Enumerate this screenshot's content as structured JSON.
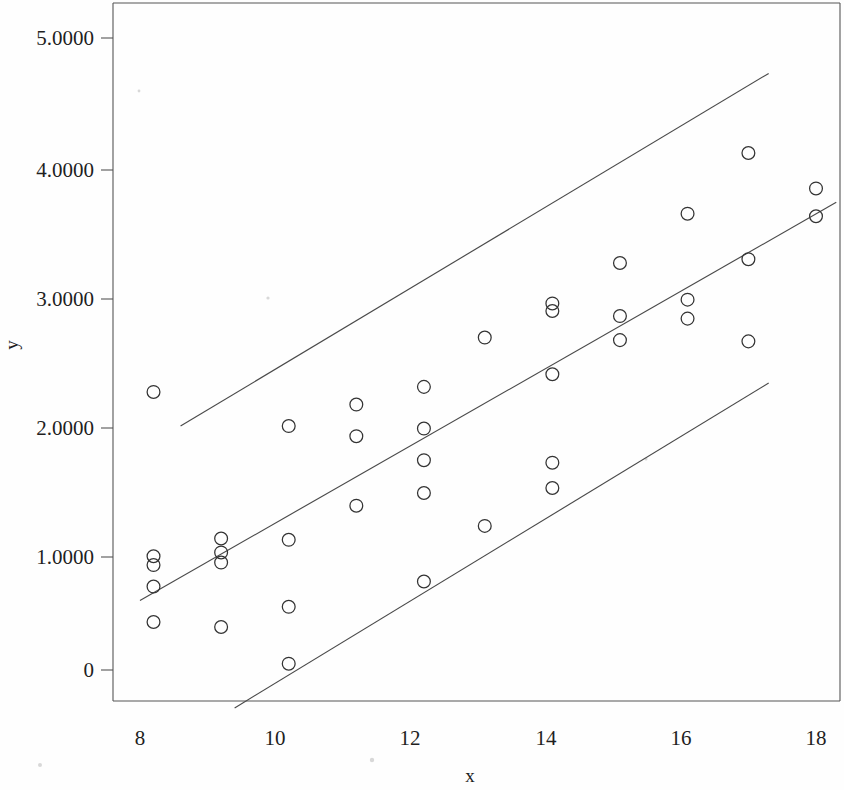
{
  "figure": {
    "background_color": "#fefefe",
    "line_color": "#4a4a4a",
    "marker_color": "#333333",
    "axis_color": "#555555"
  },
  "axes": {
    "x_title": "x",
    "y_title": "y",
    "x_ticks": [
      "8",
      "10",
      "12",
      "14",
      "16",
      "18"
    ],
    "y_ticks": [
      "5.0000",
      "4.0000",
      "3.0000",
      "2.0000",
      "1.0000",
      "0"
    ]
  },
  "chart_data": {
    "type": "scatter",
    "title": "",
    "xlabel": "x",
    "ylabel": "y",
    "xlim": [
      7.2,
      18.5
    ],
    "ylim": [
      -0.35,
      5.4
    ],
    "x_ticks": [
      8,
      10,
      12,
      14,
      16,
      18
    ],
    "y_ticks": [
      5.0,
      4.0,
      3.0,
      2.0,
      1.0,
      0
    ],
    "y_tick_labels": [
      "5.0000",
      "4.0000",
      "3.0000",
      "2.0000",
      "1.0000",
      "0"
    ],
    "x_tick_labels": [
      "8",
      "10",
      "12",
      "14",
      "16",
      "18"
    ],
    "grid": false,
    "legend": null,
    "marker": "open-circle",
    "points": [
      {
        "x": 8.2,
        "y": 2.2
      },
      {
        "x": 8.2,
        "y": 0.9
      },
      {
        "x": 8.2,
        "y": 0.83
      },
      {
        "x": 8.2,
        "y": 0.66
      },
      {
        "x": 8.2,
        "y": 0.38
      },
      {
        "x": 9.2,
        "y": 1.04
      },
      {
        "x": 9.2,
        "y": 0.93
      },
      {
        "x": 9.2,
        "y": 0.85
      },
      {
        "x": 9.2,
        "y": 0.34
      },
      {
        "x": 10.2,
        "y": 1.93
      },
      {
        "x": 10.2,
        "y": 1.03
      },
      {
        "x": 10.2,
        "y": 0.5
      },
      {
        "x": 10.2,
        "y": 0.05
      },
      {
        "x": 11.2,
        "y": 2.1
      },
      {
        "x": 11.2,
        "y": 1.85
      },
      {
        "x": 11.2,
        "y": 1.3
      },
      {
        "x": 12.2,
        "y": 2.24
      },
      {
        "x": 12.2,
        "y": 1.91
      },
      {
        "x": 12.2,
        "y": 1.66
      },
      {
        "x": 12.2,
        "y": 1.4
      },
      {
        "x": 12.2,
        "y": 0.7
      },
      {
        "x": 13.1,
        "y": 2.63
      },
      {
        "x": 13.1,
        "y": 1.14
      },
      {
        "x": 14.1,
        "y": 2.9
      },
      {
        "x": 14.1,
        "y": 2.84
      },
      {
        "x": 14.1,
        "y": 2.34
      },
      {
        "x": 14.1,
        "y": 1.64
      },
      {
        "x": 14.1,
        "y": 1.44
      },
      {
        "x": 15.1,
        "y": 3.22
      },
      {
        "x": 15.1,
        "y": 2.8
      },
      {
        "x": 15.1,
        "y": 2.61
      },
      {
        "x": 16.1,
        "y": 3.61
      },
      {
        "x": 16.1,
        "y": 2.93
      },
      {
        "x": 16.1,
        "y": 2.78
      },
      {
        "x": 17.0,
        "y": 4.09
      },
      {
        "x": 17.0,
        "y": 3.25
      },
      {
        "x": 17.0,
        "y": 2.6
      },
      {
        "x": 18.0,
        "y": 3.81
      },
      {
        "x": 18.0,
        "y": 3.59
      }
    ],
    "lines": [
      {
        "name": "upper-prediction-band",
        "x_start": 8.6,
        "y_start": 1.93,
        "x_end": 17.3,
        "y_end": 4.72
      },
      {
        "name": "regression-fit-line",
        "x_start": 8.0,
        "y_start": 0.55,
        "x_end": 18.3,
        "y_end": 3.7
      },
      {
        "name": "lower-prediction-band",
        "x_start": 9.4,
        "y_start": -0.3,
        "x_end": 17.3,
        "y_end": 2.27
      }
    ]
  }
}
